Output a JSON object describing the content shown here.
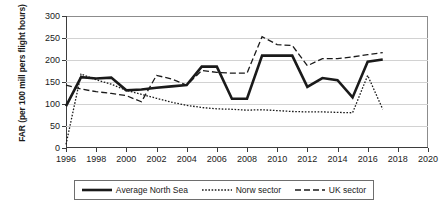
{
  "chart_data": {
    "type": "line",
    "title": "",
    "xlabel": "",
    "ylabel": "FAR (per 100 mill pers flight hours)",
    "xlim": [
      1996,
      2020
    ],
    "ylim": [
      0,
      300
    ],
    "xticks": [
      1996,
      1998,
      2000,
      2002,
      2004,
      2006,
      2008,
      2010,
      2012,
      2014,
      2016,
      2018,
      2020
    ],
    "yticks": [
      0,
      50,
      100,
      150,
      200,
      250,
      300
    ],
    "grid": "horizontal",
    "legend_position": "bottom",
    "series": [
      {
        "name": "Average North Sea",
        "style": "solid",
        "color": "#1a1a1a",
        "x": [
          1996,
          1997,
          1998,
          1999,
          2000,
          2001,
          2002,
          2003,
          2004,
          2005,
          2006,
          2007,
          2008,
          2009,
          2010,
          2011,
          2012,
          2013,
          2014,
          2015,
          2016,
          2017
        ],
        "values": [
          95,
          161,
          158,
          160,
          131,
          133,
          137,
          140,
          143,
          185,
          185,
          112,
          112,
          210,
          210,
          210,
          139,
          159,
          154,
          115,
          196,
          201
        ]
      },
      {
        "name": "Norw sector",
        "style": "dotted",
        "color": "#1a1a1a",
        "x": [
          1996,
          1997,
          1998,
          1999,
          2000,
          2001,
          2002,
          2003,
          2004,
          2005,
          2006,
          2007,
          2008,
          2009,
          2010,
          2011,
          2012,
          2013,
          2014,
          2015,
          2016,
          2017
        ],
        "values": [
          8,
          168,
          155,
          145,
          131,
          122,
          113,
          104,
          97,
          92,
          89,
          88,
          86,
          87,
          85,
          83,
          82,
          82,
          81,
          80,
          165,
          88
        ]
      },
      {
        "name": "UK sector",
        "style": "dashed",
        "color": "#1a1a1a",
        "x": [
          1996,
          1997,
          1998,
          1999,
          2000,
          2001,
          2002,
          2003,
          2004,
          2005,
          2006,
          2007,
          2008,
          2009,
          2010,
          2011,
          2012,
          2013,
          2014,
          2015,
          2016,
          2017
        ],
        "values": [
          143,
          134,
          128,
          124,
          119,
          105,
          165,
          157,
          143,
          176,
          172,
          170,
          170,
          253,
          235,
          233,
          187,
          203,
          203,
          207,
          212,
          217
        ]
      }
    ]
  },
  "legend": {
    "items": [
      {
        "label": "Average North Sea",
        "swatch": "solid-line-swatch"
      },
      {
        "label": "Norw sector",
        "swatch": "dotted-line-swatch"
      },
      {
        "label": "UK sector",
        "swatch": "dashed-line-swatch"
      }
    ]
  }
}
